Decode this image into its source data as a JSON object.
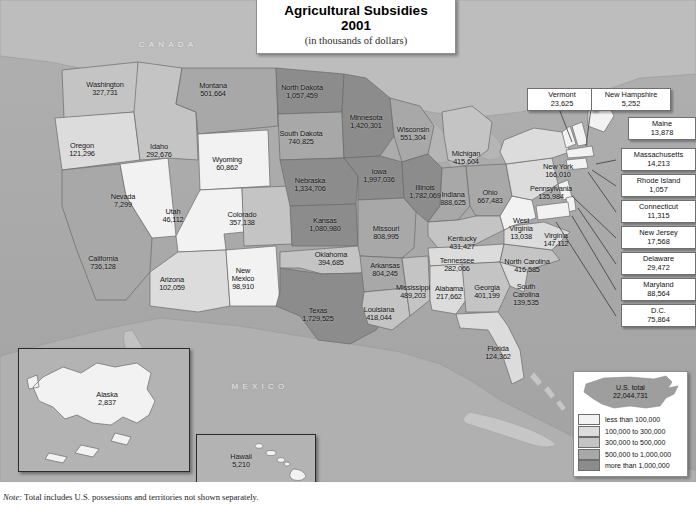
{
  "title": {
    "line1": "Agricultural Subsidies",
    "line2": "2001",
    "line3": "(in thousands of dollars)"
  },
  "note": {
    "label": "Note:",
    "text": " Total includes U.S. possessions and territories not shown separately."
  },
  "country_labels": [
    {
      "name": "CANADA"
    },
    {
      "name": "MEXICO"
    }
  ],
  "legend": {
    "total_label": "U.S. total",
    "total_value": "22,044,731",
    "classes": [
      {
        "label": "less than 100,000",
        "color": "#f2f2f2"
      },
      {
        "label": "100,000 to 300,000",
        "color": "#dcdcdc"
      },
      {
        "label": "300,000 to 500,000",
        "color": "#c4c4c4"
      },
      {
        "label": "500,000 to 1,000,000",
        "color": "#a8a8a8"
      },
      {
        "label": "more than 1,000,000",
        "color": "#8c8c8c"
      }
    ]
  },
  "insets": [
    {
      "name": "Alaska",
      "value": "2,837"
    },
    {
      "name": "Hawaii",
      "value": "5,210"
    }
  ],
  "states": [
    {
      "name": "Washington",
      "value": "327,731",
      "x": 105,
      "y": 89,
      "two": false
    },
    {
      "name": "Oregon",
      "value": "121,296",
      "x": 82,
      "y": 150,
      "two": false
    },
    {
      "name": "Idaho",
      "value": "292,676",
      "x": 159,
      "y": 151,
      "two": false
    },
    {
      "name": "Montana",
      "value": "501,664",
      "x": 213,
      "y": 90,
      "two": false
    },
    {
      "name": "Wyoming",
      "value": "60,862",
      "x": 227,
      "y": 164,
      "two": false
    },
    {
      "name": "Nevada",
      "value": "7,299",
      "x": 123,
      "y": 201,
      "two": false
    },
    {
      "name": "Utah",
      "value": "46,112",
      "x": 173,
      "y": 216,
      "two": false
    },
    {
      "name": "California",
      "value": "736,128",
      "x": 103,
      "y": 263,
      "two": false
    },
    {
      "name": "Arizona",
      "value": "102,059",
      "x": 172,
      "y": 284,
      "two": false
    },
    {
      "name": "New Mexico",
      "value": "98,910",
      "x": 243,
      "y": 279,
      "two": true
    },
    {
      "name": "Colorado",
      "value": "357,138",
      "x": 242,
      "y": 219,
      "two": false
    },
    {
      "name": "North Dakota",
      "value": "1,057,459",
      "x": 302,
      "y": 92,
      "two": false
    },
    {
      "name": "South Dakota",
      "value": "740,825",
      "x": 301,
      "y": 138,
      "two": false
    },
    {
      "name": "Nebraska",
      "value": "1,334,706",
      "x": 310,
      "y": 185,
      "two": false
    },
    {
      "name": "Kansas",
      "value": "1,080,980",
      "x": 325,
      "y": 225,
      "two": false
    },
    {
      "name": "Oklahoma",
      "value": "394,685",
      "x": 331,
      "y": 259,
      "two": false
    },
    {
      "name": "Texas",
      "value": "1,729,525",
      "x": 318,
      "y": 315,
      "two": false
    },
    {
      "name": "Minnesota",
      "value": "1,420,301",
      "x": 366,
      "y": 122,
      "two": false
    },
    {
      "name": "Iowa",
      "value": "1,997,036",
      "x": 379,
      "y": 176,
      "two": false
    },
    {
      "name": "Missouri",
      "value": "808,995",
      "x": 386,
      "y": 233,
      "two": false
    },
    {
      "name": "Arkansas",
      "value": "804,245",
      "x": 385,
      "y": 270,
      "two": false
    },
    {
      "name": "Louisiana",
      "value": "418,044",
      "x": 379,
      "y": 314,
      "two": false
    },
    {
      "name": "Wisconsin",
      "value": "551,304",
      "x": 413,
      "y": 134,
      "two": false
    },
    {
      "name": "Illinois",
      "value": "1,782,069",
      "x": 425,
      "y": 192,
      "two": false
    },
    {
      "name": "Mississippi",
      "value": "489,203",
      "x": 413,
      "y": 292,
      "two": false
    },
    {
      "name": "Michigan",
      "value": "415,604",
      "x": 466,
      "y": 158,
      "two": false
    },
    {
      "name": "Indiana",
      "value": "888,625",
      "x": 453,
      "y": 199,
      "two": false
    },
    {
      "name": "Ohio",
      "value": "667,483",
      "x": 490,
      "y": 197,
      "two": false
    },
    {
      "name": "Kentucky",
      "value": "431,427",
      "x": 462,
      "y": 243,
      "two": false
    },
    {
      "name": "Tennessee",
      "value": "282,066",
      "x": 457,
      "y": 265,
      "two": false
    },
    {
      "name": "Alabama",
      "value": "217,662",
      "x": 449,
      "y": 293,
      "two": false
    },
    {
      "name": "Georgia",
      "value": "401,199",
      "x": 487,
      "y": 292,
      "two": false
    },
    {
      "name": "Florida",
      "value": "124,362",
      "x": 498,
      "y": 353,
      "two": false
    },
    {
      "name": "South Carolina",
      "value": "139,535",
      "x": 526,
      "y": 295,
      "two": true
    },
    {
      "name": "North Carolina",
      "value": "416,585",
      "x": 527,
      "y": 266,
      "two": false
    },
    {
      "name": "West Virginia",
      "value": "13,038",
      "x": 521,
      "y": 229,
      "two": true
    },
    {
      "name": "Virginia",
      "value": "147,112",
      "x": 556,
      "y": 240,
      "two": false
    },
    {
      "name": "Pennsylvania",
      "value": "135,984",
      "x": 551,
      "y": 193,
      "two": false
    },
    {
      "name": "New York",
      "value": "166,010",
      "x": 558,
      "y": 171,
      "two": false
    }
  ],
  "callouts": [
    {
      "name": "Vermont",
      "value": "23,625",
      "x": 527,
      "y": 88,
      "w": 60
    },
    {
      "name": "New Hampshire",
      "value": "5,252",
      "x": 591,
      "y": 88,
      "w": 70
    },
    {
      "name": "Maine",
      "value": "13,878",
      "x": 628,
      "y": 117,
      "w": 58
    },
    {
      "name": "Massachusetts",
      "value": "14,213",
      "x": 621,
      "y": 148,
      "w": 65
    },
    {
      "name": "Rhode Island",
      "value": "1,057",
      "x": 621,
      "y": 174,
      "w": 65
    },
    {
      "name": "Connecticut",
      "value": "11,315",
      "x": 621,
      "y": 200,
      "w": 65
    },
    {
      "name": "New Jersey",
      "value": "17,568",
      "x": 621,
      "y": 226,
      "w": 65
    },
    {
      "name": "Delaware",
      "value": "29,472",
      "x": 621,
      "y": 252,
      "w": 65
    },
    {
      "name": "Maryland",
      "value": "88,564",
      "x": 621,
      "y": 278,
      "w": 65
    },
    {
      "name": "D.C.",
      "value": "75,864",
      "x": 621,
      "y": 304,
      "w": 65
    }
  ]
}
